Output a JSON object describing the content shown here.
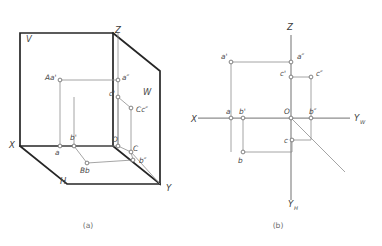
{
  "figure": {
    "captions": [
      {
        "id": "caption-a",
        "text": "(a)",
        "x": 88,
        "y": 228
      },
      {
        "id": "caption-b",
        "text": "(b)",
        "x": 278,
        "y": 228
      }
    ]
  },
  "diagram_a": {
    "name": "pictorial-three-plane-box",
    "plane_labels": [
      {
        "id": "plane-v",
        "text": "V",
        "x": 26,
        "y": 42
      },
      {
        "id": "plane-w",
        "text": "W",
        "x": 143,
        "y": 95
      },
      {
        "id": "plane-h",
        "text": "H",
        "x": 60,
        "y": 184
      }
    ],
    "axis_labels": [
      {
        "id": "axis-z",
        "text": "Z",
        "x": 115,
        "y": 33
      },
      {
        "id": "axis-x",
        "text": "X",
        "x": 9,
        "y": 148
      },
      {
        "id": "axis-y",
        "text": "Y",
        "x": 166,
        "y": 191
      }
    ],
    "point_labels": [
      {
        "id": "pt-Aa-prime",
        "text": "Aa'",
        "x": 45,
        "y": 80
      },
      {
        "id": "pt-a-dprime",
        "text": "a″",
        "x": 122,
        "y": 80
      },
      {
        "id": "pt-c-prime",
        "text": "c'",
        "x": 109,
        "y": 96
      },
      {
        "id": "pt-Cc-dprime",
        "text": "Cc″",
        "x": 136,
        "y": 112
      },
      {
        "id": "pt-b-prime",
        "text": "b'",
        "x": 70,
        "y": 140
      },
      {
        "id": "pt-a",
        "text": "a",
        "x": 55,
        "y": 155
      },
      {
        "id": "pt-O",
        "text": "O",
        "x": 112,
        "y": 142
      },
      {
        "id": "pt-C",
        "text": "C",
        "x": 133,
        "y": 151
      },
      {
        "id": "pt-b-dprime",
        "text": "b″",
        "x": 139,
        "y": 163
      },
      {
        "id": "pt-Bb",
        "text": "Bb",
        "x": 80,
        "y": 173
      }
    ],
    "nodes": [
      {
        "id": "node-Aa-prime",
        "x": 60,
        "y": 80
      },
      {
        "id": "node-a-dprime",
        "x": 118,
        "y": 80
      },
      {
        "id": "node-c-prime",
        "x": 118,
        "y": 97
      },
      {
        "id": "node-Cc-dprime",
        "x": 131,
        "y": 108
      },
      {
        "id": "node-a",
        "x": 60,
        "y": 146
      },
      {
        "id": "node-b-prime",
        "x": 74,
        "y": 146
      },
      {
        "id": "node-O",
        "x": 118,
        "y": 146
      },
      {
        "id": "node-C",
        "x": 131,
        "y": 152
      },
      {
        "id": "node-b-dprime",
        "x": 133,
        "y": 160
      },
      {
        "id": "node-Bb",
        "x": 87,
        "y": 163
      }
    ]
  },
  "diagram_b": {
    "name": "orthographic-projection-axes",
    "axis_labels": [
      {
        "id": "axis-z-b",
        "text": "Z",
        "x": 287,
        "y": 30
      },
      {
        "id": "axis-x-b",
        "text": "X",
        "x": 191,
        "y": 122
      },
      {
        "id": "axis-yw-main",
        "text": "Y",
        "x": 354,
        "y": 121
      },
      {
        "id": "axis-yw-sub",
        "text": "W",
        "x": 360,
        "y": 124
      },
      {
        "id": "axis-yh-main",
        "text": "Y",
        "x": 288,
        "y": 207
      },
      {
        "id": "axis-yh-sub",
        "text": "H",
        "x": 294,
        "y": 210
      }
    ],
    "point_labels": [
      {
        "id": "pt-b-a-prime",
        "text": "a'",
        "x": 221,
        "y": 59
      },
      {
        "id": "pt-b-a-dprime",
        "text": "a″",
        "x": 297,
        "y": 59
      },
      {
        "id": "pt-b-c-prime",
        "text": "c'",
        "x": 280,
        "y": 76
      },
      {
        "id": "pt-b-c-dprime",
        "text": "c″",
        "x": 316,
        "y": 76
      },
      {
        "id": "pt-b-a",
        "text": "a",
        "x": 226,
        "y": 114
      },
      {
        "id": "pt-b-b-prime",
        "text": "b'",
        "x": 239,
        "y": 114
      },
      {
        "id": "pt-b-O",
        "text": "O",
        "x": 284,
        "y": 114
      },
      {
        "id": "pt-b-b-dprime",
        "text": "b″",
        "x": 309,
        "y": 114
      },
      {
        "id": "pt-b-c",
        "text": "c",
        "x": 284,
        "y": 143
      },
      {
        "id": "pt-b-b",
        "text": "b",
        "x": 238,
        "y": 163
      }
    ],
    "nodes": [
      {
        "id": "node-b-a-prime",
        "x": 231,
        "y": 62
      },
      {
        "id": "node-b-a-dprime",
        "x": 291,
        "y": 62
      },
      {
        "id": "node-b-c-prime",
        "x": 291,
        "y": 77
      },
      {
        "id": "node-b-c-dprime",
        "x": 311,
        "y": 77
      },
      {
        "id": "node-b-a",
        "x": 231,
        "y": 118
      },
      {
        "id": "node-b-b-prime",
        "x": 243,
        "y": 118
      },
      {
        "id": "node-b-O",
        "x": 291,
        "y": 118
      },
      {
        "id": "node-b-b-dprime",
        "x": 311,
        "y": 118
      },
      {
        "id": "node-b-c",
        "x": 292,
        "y": 140
      },
      {
        "id": "node-b-b",
        "x": 243,
        "y": 152
      }
    ]
  },
  "colors": {
    "frame_stroke": "#262626",
    "thin_stroke": "#8e8e8e",
    "node_fill": "#ffffff",
    "text": "#4a4a4a",
    "background": "#ffffff"
  }
}
